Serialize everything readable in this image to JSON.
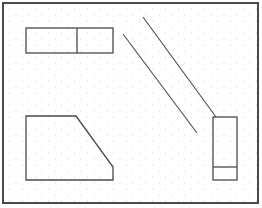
{
  "diagram": {
    "type": "floor-plan-sketch",
    "background": "#ffffff",
    "dot_color": "#c8c8c8",
    "stroke_color": "#4a4a4a",
    "frame": {
      "x": 3,
      "y": 3,
      "width": 255,
      "height": 200,
      "stroke_width": 2
    },
    "shapes": {
      "top_rect": {
        "x": 26,
        "y": 28,
        "width": 87,
        "height": 25,
        "divider_x": 77
      },
      "diagonal_line_1": {
        "x1": 123,
        "y1": 34,
        "x2": 197,
        "y2": 133
      },
      "diagonal_line_2": {
        "x1": 143,
        "y1": 17,
        "x2": 216,
        "y2": 117
      },
      "trapezoid": {
        "points": "26,116 76,116 113,167 113,180 26,180"
      },
      "small_rect": {
        "x": 213,
        "y": 117,
        "width": 24,
        "height": 63,
        "divider_y": 167
      }
    }
  }
}
